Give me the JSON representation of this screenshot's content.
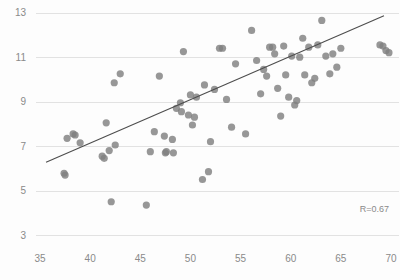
{
  "chart_data": {
    "type": "scatter",
    "title": "",
    "subtitle": "",
    "xlabel": "",
    "ylabel": "",
    "xlim": [
      34.0,
      70.8
    ],
    "ylim": [
      2.6,
      13.3
    ],
    "grid": true,
    "grid_axis": "y",
    "legend": "none",
    "xticks": [
      35,
      40,
      45,
      50,
      55,
      60,
      65,
      70
    ],
    "yticks": [
      3,
      5,
      7,
      9,
      11,
      13
    ],
    "xtick_labels": [
      "35",
      "40",
      "45",
      "50",
      "55",
      "60",
      "65",
      "70"
    ],
    "ytick_labels": [
      "3",
      "5",
      "7",
      "9",
      "11",
      "13"
    ],
    "annotations": [
      {
        "name": "correlation-annotation",
        "text": "R=0.67",
        "x": 69.8,
        "y": 4.05
      }
    ],
    "point_color": "#808080",
    "point_radius": 3.6,
    "gridline_color": "#e2e2e2",
    "tick_label_color": "#8a8a8a",
    "background_color": "#fdfdfd",
    "trendline": {
      "name": "linear-fit-line",
      "color": "#4d4d4d",
      "x_start": 35.6,
      "y_start": 6.28,
      "x_end": 69.3,
      "y_end": 12.86
    },
    "series": [
      {
        "name": "observations",
        "marker": "circle",
        "color": "#808080",
        "x": [
          37.4,
          37.5,
          37.7,
          38.3,
          38.5,
          39.0,
          41.2,
          41.4,
          41.6,
          41.9,
          42.1,
          42.4,
          42.5,
          43.0,
          45.6,
          46.0,
          46.4,
          46.9,
          47.4,
          47.5,
          47.6,
          48.2,
          48.3,
          48.6,
          49.0,
          49.1,
          49.3,
          49.8,
          50.0,
          50.2,
          50.4,
          50.6,
          51.2,
          51.4,
          51.8,
          52.0,
          52.4,
          52.9,
          53.2,
          53.6,
          54.1,
          54.5,
          55.5,
          56.1,
          56.6,
          57.0,
          57.3,
          57.6,
          57.9,
          58.2,
          58.4,
          58.7,
          59.0,
          59.3,
          59.5,
          59.8,
          60.1,
          60.4,
          60.6,
          60.9,
          61.2,
          61.4,
          61.8,
          62.1,
          62.4,
          62.7,
          63.1,
          63.5,
          63.9,
          64.2,
          64.6,
          65.0,
          68.9,
          69.2,
          69.5,
          69.8
        ],
        "y": [
          5.78,
          5.7,
          7.35,
          7.55,
          7.5,
          7.15,
          6.55,
          6.45,
          8.05,
          6.8,
          4.5,
          9.85,
          7.05,
          10.25,
          4.35,
          6.75,
          7.65,
          10.15,
          7.45,
          6.7,
          6.75,
          7.3,
          6.7,
          8.7,
          8.95,
          8.55,
          11.25,
          8.4,
          9.3,
          7.95,
          8.3,
          9.2,
          5.5,
          9.75,
          5.85,
          7.2,
          9.55,
          11.4,
          11.4,
          9.1,
          7.85,
          10.7,
          7.55,
          12.2,
          10.85,
          9.35,
          10.45,
          10.15,
          11.45,
          11.45,
          11.15,
          9.6,
          8.35,
          11.5,
          10.2,
          9.2,
          11.05,
          8.85,
          9.05,
          11.0,
          11.85,
          10.2,
          11.45,
          9.85,
          10.05,
          11.55,
          12.65,
          11.05,
          10.25,
          11.15,
          10.55,
          11.4,
          11.55,
          11.5,
          11.3,
          11.2
        ]
      }
    ]
  }
}
